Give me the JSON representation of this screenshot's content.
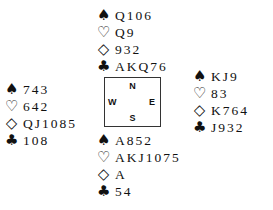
{
  "suits": {
    "spades": "♠",
    "hearts": "♡",
    "diamonds": "◇",
    "clubs": "♣"
  },
  "hands": {
    "north": {
      "spades": "Q106",
      "hearts": "Q9",
      "diamonds": "932",
      "clubs": "AKQ76"
    },
    "west": {
      "spades": "743",
      "hearts": "642",
      "diamonds": "QJ1085",
      "clubs": "108"
    },
    "east": {
      "spades": "KJ9",
      "hearts": "83",
      "diamonds": "K764",
      "clubs": "J932"
    },
    "south": {
      "spades": "A852",
      "hearts": "AKJ1075",
      "diamonds": "A",
      "clubs": "54"
    }
  },
  "compass": {
    "n": "N",
    "e": "E",
    "s": "S",
    "w": "W"
  }
}
